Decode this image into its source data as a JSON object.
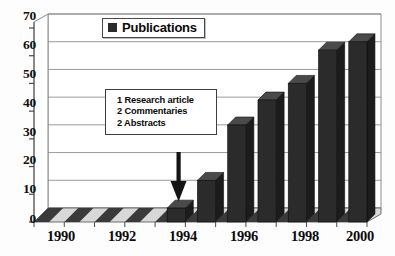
{
  "chart_data": {
    "type": "bar",
    "title": "",
    "subtitle": "",
    "xlabel": "",
    "ylabel": "",
    "ylim": [
      0,
      70
    ],
    "ytick_step": 10,
    "yticks": [
      0,
      10,
      20,
      30,
      40,
      50,
      60,
      70
    ],
    "grid": true,
    "style": "3d-column",
    "legend_position": "top-center",
    "categories": [
      "1990",
      "1991",
      "1992",
      "1993",
      "1994",
      "1995",
      "1996",
      "1997",
      "1998",
      "1999",
      "2000"
    ],
    "xtick_labels": [
      "1990",
      "1992",
      "1994",
      "1996",
      "1998",
      "2000"
    ],
    "series": [
      {
        "name": "Publications",
        "color": "#2b2b2b",
        "values": [
          0,
          0,
          0,
          0,
          5,
          15,
          35,
          44,
          50,
          62,
          65
        ]
      }
    ],
    "annotations": [
      {
        "name": "1994-composition-callout",
        "target_category": "1994",
        "lines": [
          "1 Research article",
          "2 Commentaries",
          "2 Abstracts"
        ],
        "arrow": "down"
      }
    ]
  },
  "legend": {
    "label": "Publications",
    "swatch_color": "#2b2b2b"
  },
  "callout": {
    "line1": "1 Research article",
    "line2": "2 Commentaries",
    "line3": "2 Abstracts"
  },
  "axes": {
    "y_labels": [
      "70",
      "60",
      "50",
      "40",
      "30",
      "20",
      "10",
      "0"
    ],
    "x_labels": [
      "1990",
      "1992",
      "1994",
      "1996",
      "1998",
      "2000"
    ]
  }
}
